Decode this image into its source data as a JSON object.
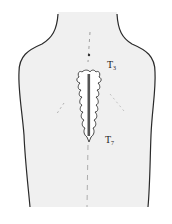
{
  "figure": {
    "type": "anatomical-illustration",
    "background_color": "#ffffff",
    "skin_color": "#f0f0f0",
    "outline_color": "#2a2a2a",
    "incision_color": "#555555"
  },
  "labels": {
    "upper": {
      "base": "T",
      "sub": "3"
    },
    "lower": {
      "base": "T",
      "sub": "7"
    }
  }
}
